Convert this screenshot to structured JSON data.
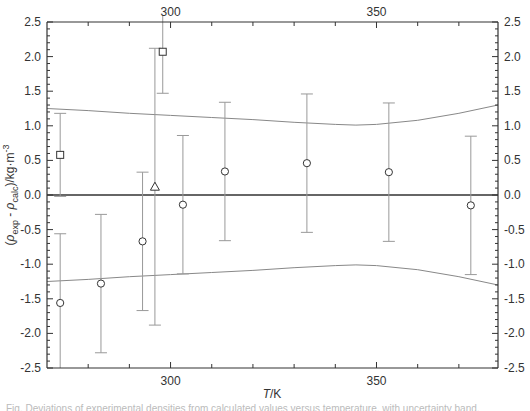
{
  "chart_data": {
    "type": "scatter",
    "title": "",
    "xlabel": "T/K",
    "ylabel": "(ρ_exp - ρ_calc)/kg·m^-3",
    "xlim": [
      270,
      379.5
    ],
    "ylim": [
      -2.5,
      2.5
    ],
    "x_ticks_major": [
      300,
      350
    ],
    "x_tick_labels": [
      "300",
      "350"
    ],
    "y_ticks_major": [
      -2.5,
      -2.0,
      -1.5,
      -1.0,
      -0.5,
      0.0,
      0.5,
      1.0,
      1.5,
      2.0,
      2.5
    ],
    "y_tick_labels": [
      "-2.5",
      "-2.0",
      "-1.5",
      "-1.0",
      "-0.5",
      "0.0",
      "0.5",
      "1.0",
      "1.5",
      "2.0",
      "2.5"
    ],
    "grid": false,
    "legend": null,
    "zero_line": 0.0,
    "series": [
      {
        "name": "circles",
        "marker": "circle",
        "points": [
          {
            "x": 273.2,
            "y": -1.56,
            "err": 1.0
          },
          {
            "x": 283.1,
            "y": -1.28,
            "err": 1.0
          },
          {
            "x": 293.2,
            "y": -0.67,
            "err": 1.0
          },
          {
            "x": 303.0,
            "y": -0.14,
            "err": 1.0
          },
          {
            "x": 313.2,
            "y": 0.34,
            "err": 1.0
          },
          {
            "x": 333.1,
            "y": 0.46,
            "err": 1.0
          },
          {
            "x": 353.0,
            "y": 0.33,
            "err": 1.0
          },
          {
            "x": 372.9,
            "y": -0.15,
            "err": 1.0
          }
        ]
      },
      {
        "name": "squares",
        "marker": "square",
        "points": [
          {
            "x": 273.2,
            "y": 0.58,
            "err": 0.6
          },
          {
            "x": 298.1,
            "y": 2.07,
            "err": 0.6
          }
        ]
      },
      {
        "name": "triangles",
        "marker": "triangle",
        "points": [
          {
            "x": 296.2,
            "y": 0.12,
            "err": 2.0
          }
        ]
      }
    ],
    "uncertainty_band": {
      "x": [
        270,
        280,
        290,
        300,
        310,
        320,
        330,
        340,
        345,
        350,
        360,
        370,
        379.5
      ],
      "upper": [
        1.25,
        1.22,
        1.18,
        1.15,
        1.12,
        1.09,
        1.05,
        1.02,
        1.01,
        1.02,
        1.08,
        1.18,
        1.3
      ],
      "lower": [
        -1.25,
        -1.22,
        -1.18,
        -1.15,
        -1.12,
        -1.09,
        -1.05,
        -1.02,
        -1.01,
        -1.02,
        -1.08,
        -1.18,
        -1.3
      ]
    }
  },
  "axes": {
    "x_title_italic": "T",
    "x_title_rest": "/K",
    "y_title": "(ρexp - ρcalc)/kg·m-3"
  },
  "caption": "Fig. Deviations of experimental densities from calculated values versus temperature, with uncertainty band."
}
